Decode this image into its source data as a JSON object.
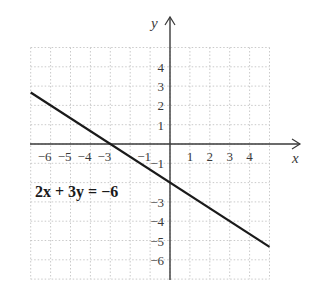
{
  "chart_data": {
    "type": "line",
    "title": "",
    "equation_label": "2x + 3y = −6",
    "xlabel": "x",
    "ylabel": "y",
    "xlim": [
      -7,
      5
    ],
    "ylim": [
      -7,
      5
    ],
    "grid": true,
    "grid_style": "dotted",
    "x_tick_labels": [
      "−6",
      "−5",
      "−4",
      "−3",
      "−1",
      "1",
      "2",
      "3",
      "4"
    ],
    "x_tick_values": [
      -6,
      -5,
      -4,
      -3,
      -1,
      1,
      2,
      3,
      4
    ],
    "y_tick_labels": [
      "4",
      "3",
      "2",
      "1",
      "−1",
      "−3",
      "−4",
      "−5",
      "−6"
    ],
    "y_tick_values": [
      4,
      3,
      2,
      1,
      -1,
      -3,
      -4,
      -5,
      -6
    ],
    "series": [
      {
        "name": "2x + 3y = −6",
        "x": [
          -7,
          5
        ],
        "y": [
          2.667,
          -5.333
        ],
        "x_intercept": -3,
        "y_intercept": -2
      }
    ],
    "colors": {
      "line": "#1a1a1a",
      "axis": "#3a3a3a",
      "grid": "#bdbdbd"
    }
  }
}
